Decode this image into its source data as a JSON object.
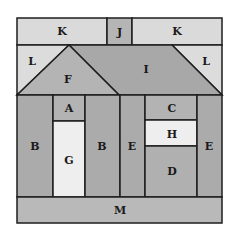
{
  "colors": {
    "dark": "#aaaaaa",
    "light": "#d9d9d9",
    "lightest": "#eeeeee",
    "medium": "#bdbdbd",
    "stroke": "#1e1e1e"
  },
  "pieces": {
    "K_left": "K",
    "J": "J",
    "K_right": "K",
    "L_left": "L",
    "L_right": "L",
    "F": "F",
    "I": "I",
    "A": "A",
    "G": "G",
    "B_left": "B",
    "B_right": "B",
    "E_left": "E",
    "E_right": "E",
    "C": "C",
    "H": "H",
    "D": "D",
    "M": "M"
  }
}
